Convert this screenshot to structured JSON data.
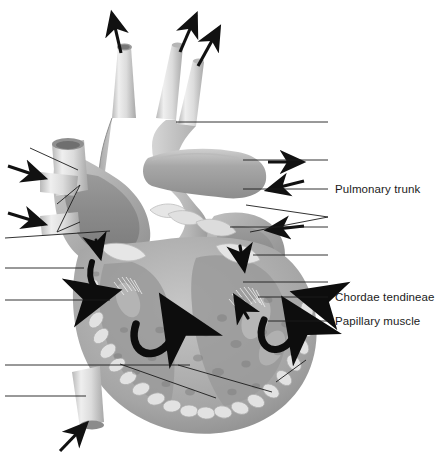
{
  "figure": {
    "kind": "anatomical-illustration",
    "style": "grayscale medical illustration with unlabeled leader lines",
    "background_color": "#ffffff",
    "line_color": "#1b1b1b",
    "text_color": "#1b1b1b",
    "width": 433,
    "height": 456
  },
  "top_cut_text": "",
  "labels": [
    {
      "id": "pulmonary-trunk",
      "text": "Pulmonary trunk",
      "x": 335,
      "y": 189
    },
    {
      "id": "chordae-tendineae",
      "text": "Chordae tendineae",
      "x": 335,
      "y": 297
    },
    {
      "id": "papillary-muscle",
      "text": "Papillary muscle",
      "x": 335,
      "y": 321
    }
  ],
  "leader_lines": {
    "right_blank": [
      {
        "id": "leader-aortic-arch",
        "points": "176,122 328,122"
      },
      {
        "id": "leader-pulmonary-artery",
        "points": "243,160 328,160"
      },
      {
        "id": "leader-pulmonary-valve",
        "points": "230,227 328,227"
      },
      {
        "id": "leader-left-atrium",
        "points": "253,255 328,255"
      },
      {
        "id": "leader-left-ventricle",
        "points": "243,282 328,282"
      }
    ],
    "right_labeled": [
      {
        "id": "leader-pulmonary-trunk",
        "points": "243,189 328,189"
      },
      {
        "id": "leader-chordae-tendineae",
        "points": "258,297 328,297"
      },
      {
        "id": "leader-papillary-muscle",
        "points": "268,321 328,321"
      }
    ],
    "right_forked": [
      {
        "id": "leader-fork-upper",
        "points": "246,205 328,217"
      },
      {
        "id": "leader-fork-lower",
        "points": "250,232 328,217"
      }
    ],
    "left_blank": [
      {
        "id": "leader-superior-vena-cava",
        "points": "30,148 78,170"
      },
      {
        "id": "leader-pulmonary-veins",
        "points": "57,204 80,185 57,232 80,222"
      },
      {
        "id": "leader-right-atrium-wall",
        "points": "5,238 108,232"
      },
      {
        "id": "leader-tricuspid-valve",
        "points": "5,268 84,268"
      },
      {
        "id": "leader-right-ventricle",
        "points": "5,300 110,300"
      },
      {
        "id": "leader-interventricular",
        "points": "5,365 190,365"
      },
      {
        "id": "leader-inferior-vena-cava",
        "points": "5,396 86,396"
      }
    ],
    "internal_diagonal": [
      {
        "id": "leader-septum-diagonal",
        "points": "120,364 215,398"
      },
      {
        "id": "leader-apex-diagonal",
        "points": "178,365 272,392"
      },
      {
        "id": "leader-left-wall-diagonal",
        "points": "305,360 278,382"
      }
    ]
  },
  "flow_arrows": {
    "outflow_top": [
      {
        "id": "arrow-brachiocephalic",
        "from": "121,53",
        "to": "112,13"
      },
      {
        "id": "arrow-left-carotid",
        "from": "180,52",
        "to": "196,14"
      },
      {
        "id": "arrow-left-subclavian",
        "from": "198,66",
        "to": "219,27"
      }
    ],
    "inflow_left": [
      {
        "id": "arrow-svc-inflow",
        "from": "8,166",
        "to": "43,178"
      },
      {
        "id": "arrow-ivc-inflow",
        "from": "8,213",
        "to": "43,224"
      },
      {
        "id": "arrow-inferior-inflow",
        "from": "60,451",
        "to": "85,424"
      }
    ],
    "right_side": [
      {
        "id": "arrow-pulm-right-out",
        "from": "268,162",
        "to": "300,162"
      },
      {
        "id": "arrow-pulm-left-in",
        "from": "303,182",
        "to": "268,190"
      },
      {
        "id": "arrow-pulm-vein-in",
        "from": "303,226",
        "to": "268,230"
      }
    ],
    "internal_curved": [
      {
        "id": "arrow-ra-down",
        "note": "small downward arrow in right atrium"
      },
      {
        "id": "arrow-ra-curl",
        "note": "curved arrow right atrium to right ventricle"
      },
      {
        "id": "arrow-rv-curl",
        "note": "large curved arrow in right ventricle outflow"
      },
      {
        "id": "arrow-la-down",
        "note": "downward arrow in left atrium"
      },
      {
        "id": "arrow-lv-curl",
        "note": "curved arrow in left ventricle"
      },
      {
        "id": "arrow-lv-inflow",
        "note": "small arrow into left ventricle"
      },
      {
        "id": "arrow-aorta-out",
        "note": "thick black arrow at aortic outflow"
      }
    ]
  }
}
